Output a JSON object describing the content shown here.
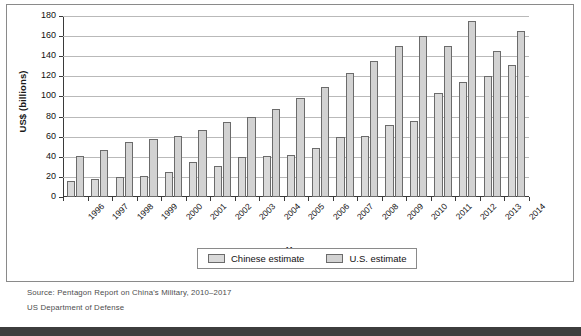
{
  "chart_data": {
    "type": "bar",
    "title": "",
    "xlabel": "Year",
    "ylabel": "US$ (billions)",
    "ylim": [
      0,
      180
    ],
    "yticks": [
      0,
      20,
      40,
      60,
      80,
      100,
      120,
      140,
      160,
      180
    ],
    "grid": true,
    "legend_position": "bottom",
    "categories": [
      "1996",
      "1997",
      "1998",
      "1999",
      "2000",
      "2001",
      "2002",
      "2003",
      "2004",
      "2005",
      "2006",
      "2007",
      "2008",
      "2009",
      "2010",
      "2011",
      "2012",
      "2013",
      "2014"
    ],
    "series": [
      {
        "name": "Chinese estimate",
        "color": "#d9d9d9",
        "values": [
          16,
          18,
          20,
          21,
          25,
          35,
          31,
          40,
          41,
          42,
          49,
          60,
          61,
          72,
          76,
          103,
          114,
          120,
          131
        ]
      },
      {
        "name": "U.S. estimate",
        "color": "#d2d2d2",
        "values": [
          41,
          47,
          55,
          58,
          61,
          67,
          75,
          80,
          88,
          98,
          109,
          123,
          135,
          150,
          160,
          150,
          175,
          145,
          165
        ]
      }
    ]
  },
  "legend": {
    "items": [
      {
        "label": "Chinese estimate",
        "swatch": "chinese-estimate-swatch"
      },
      {
        "label": "U.S. estimate",
        "swatch": "us-estimate-swatch"
      }
    ]
  },
  "source": {
    "line1": "Source: Pentagon Report on China's Military, 2010–2017",
    "line2": "US Department of Defense"
  }
}
